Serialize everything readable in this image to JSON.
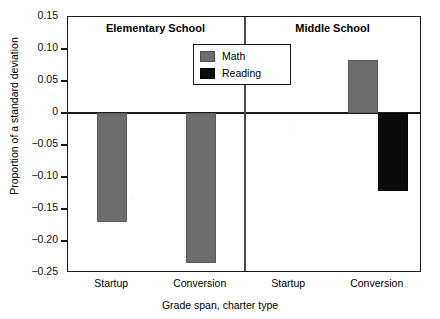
{
  "chart_data": {
    "type": "bar",
    "title": "",
    "xlabel": "Grade span, charter type",
    "ylabel": "Proportion of a standard deviation",
    "ylim": [
      -0.25,
      0.15
    ],
    "yticks": [
      0.15,
      0.1,
      0.05,
      0,
      -0.05,
      -0.1,
      -0.15,
      -0.2,
      -0.25
    ],
    "ytick_labels": [
      "0.15",
      "0.10",
      "0.05",
      "0",
      "−0.05",
      "−0.10",
      "−0.15",
      "−0.20",
      "−0.25"
    ],
    "grid": false,
    "legend_position": "top-center",
    "panels": [
      {
        "name": "Elementary School",
        "categories": [
          "Startup",
          "Conversion"
        ]
      },
      {
        "name": "Middle School",
        "categories": [
          "Startup",
          "Conversion"
        ]
      }
    ],
    "categories": [
      "Startup",
      "Conversion",
      "Startup",
      "Conversion"
    ],
    "series": [
      {
        "name": "Math",
        "color": "#6d6d6d",
        "values": [
          -0.17,
          -0.235,
          null,
          0.083
        ]
      },
      {
        "name": "Reading",
        "color": "#0b0b0b",
        "values": [
          null,
          null,
          null,
          -0.122
        ]
      }
    ],
    "bars": [
      {
        "panel": "Elementary School",
        "category": "Startup",
        "series": "Math",
        "value": -0.17
      },
      {
        "panel": "Elementary School",
        "category": "Conversion",
        "series": "Math",
        "value": -0.235
      },
      {
        "panel": "Middle School",
        "category": "Conversion",
        "series": "Math",
        "value": 0.083
      },
      {
        "panel": "Middle School",
        "category": "Conversion",
        "series": "Reading",
        "value": -0.122
      }
    ]
  },
  "legend": {
    "items": [
      {
        "label": "Math"
      },
      {
        "label": "Reading"
      }
    ]
  },
  "axes": {
    "y_title": "Proportion of a standard deviation",
    "x_title": "Grade span, charter type",
    "y_ticks": [
      {
        "label": "0.15",
        "value": 0.15
      },
      {
        "label": "0.10",
        "value": 0.1
      },
      {
        "label": "0.05",
        "value": 0.05
      },
      {
        "label": "0",
        "value": 0
      },
      {
        "label": "−0.05",
        "value": -0.05
      },
      {
        "label": "−0.10",
        "value": -0.1
      },
      {
        "label": "−0.15",
        "value": -0.15
      },
      {
        "label": "−0.20",
        "value": -0.2
      },
      {
        "label": "−0.25",
        "value": -0.25
      }
    ],
    "x_ticks": [
      {
        "label": "Startup"
      },
      {
        "label": "Conversion"
      },
      {
        "label": "Startup"
      },
      {
        "label": "Conversion"
      }
    ]
  },
  "panel_titles": [
    {
      "label": "Elementary School"
    },
    {
      "label": "Middle School"
    }
  ]
}
